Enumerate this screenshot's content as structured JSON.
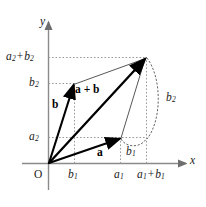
{
  "figure": {
    "background_color": "#ffffff",
    "axis_color": "#8a8a8a",
    "grid_color": "#9a9a9a",
    "vector_color": "#000000",
    "thin_line_color": "#555555",
    "label_color": "#1a1a1a"
  },
  "axes": {
    "x_label": "x",
    "y_label": "y",
    "origin_label": "O"
  },
  "ticks": {
    "x": [
      {
        "id": "b1",
        "base": "b",
        "sub": "1"
      },
      {
        "id": "a1",
        "base": "a",
        "sub": "1"
      },
      {
        "id": "a1b1",
        "base": "a",
        "sub": "1",
        "plus": "+",
        "base2": "b",
        "sub2": "1"
      }
    ],
    "y": [
      {
        "id": "a2",
        "base": "a",
        "sub": "2"
      },
      {
        "id": "b2",
        "base": "b",
        "sub": "2"
      },
      {
        "id": "a2b2",
        "base": "a",
        "sub": "2",
        "plus": "+",
        "base2": "b",
        "sub2": "2"
      }
    ]
  },
  "vectors": [
    {
      "id": "a",
      "label": "a",
      "from": "origin",
      "to": "a1-a2"
    },
    {
      "id": "b",
      "label": "b",
      "from": "origin",
      "to": "b1-b2"
    },
    {
      "id": "sum",
      "label": "a + b",
      "from": "origin",
      "to": "a1b1-a2b2"
    }
  ],
  "braces": [
    {
      "id": "brace-b1",
      "base": "b",
      "sub": "1"
    },
    {
      "id": "brace-b2",
      "base": "b",
      "sub": "2"
    }
  ]
}
